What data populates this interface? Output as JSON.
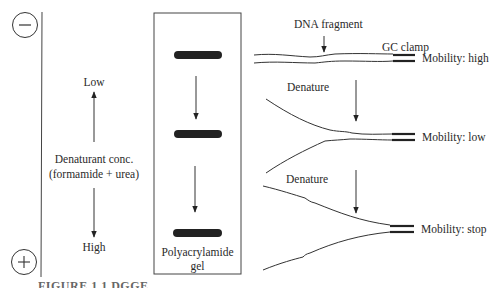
{
  "electrodes": {
    "negative": {
      "symbol": "−",
      "name": "cathode"
    },
    "positive": {
      "symbol": "+",
      "name": "anode"
    }
  },
  "gradient": {
    "low_label": "Low",
    "title_line1": "Denaturant conc.",
    "title_line2": "(formamide + urea)",
    "high_label": "High"
  },
  "gel": {
    "label_line1": "Polyacrylamide",
    "label_line2": "gel",
    "bands": [
      {
        "position": "top",
        "y": 55
      },
      {
        "position": "middle",
        "y": 134
      },
      {
        "position": "bottom",
        "y": 233
      }
    ]
  },
  "dna": {
    "fragment_label": "DNA fragment",
    "clamp_label": "GC clamp",
    "states": [
      {
        "mobility": "Mobility: high",
        "denature_label": null
      },
      {
        "mobility": "Mobility: low",
        "denature_label": "Denature"
      },
      {
        "mobility": "Mobility: stop",
        "denature_label": "Denature"
      }
    ]
  },
  "caption": "FIGURE 1.1  DGGE ..."
}
